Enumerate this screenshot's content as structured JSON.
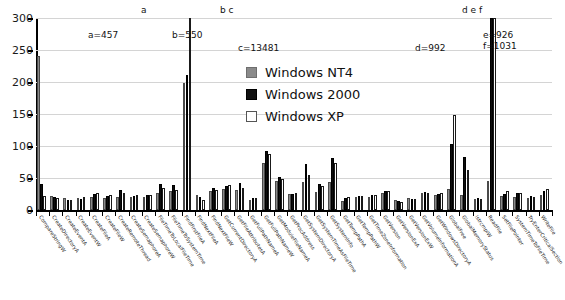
{
  "chart_data": {
    "type": "bar",
    "title": "",
    "xlabel": "",
    "ylabel": "",
    "ylim": [
      0,
      300
    ],
    "ytick_values": [
      0,
      50,
      100,
      150,
      200,
      250,
      300
    ],
    "ytick_labels": [
      "0",
      "50",
      "100",
      "150",
      "200",
      "250",
      "300"
    ],
    "grid": true,
    "legend_position": "upper center",
    "categories": [
      "CompareStringW",
      "CreateDirectoryA",
      "CreateEventA",
      "CreateEventW",
      "CreateFileA",
      "CreateFileW",
      "CreateRemoteThread",
      "CreateSemaphoreA",
      "CreateSemaphoreW",
      "FileTimeToLocalFileTime",
      "FileTimeToSystemTime",
      "FindFirstFileA",
      "FindNextFileA",
      "FindNextFileW",
      "GetCurrentDirectoryA",
      "GetFileAttributesA",
      "GetFullPathNameA",
      "GetFullPathNameW",
      "GetModuleFileNameA",
      "GetProcAddress",
      "GetSystemDirectoryA",
      "GetSystemTimeAsFileTime",
      "GetSystemInfo",
      "GetTempPathA",
      "GetTempPathW",
      "GetTimeZoneInformation",
      "GetVersion",
      "GetVersionExA",
      "GetVersionExW",
      "GetVolumeInformationA",
      "GetWindowsDirectoryA",
      "GlobalFree",
      "GlobalMemoryStatus",
      "lstrcmpiW",
      "ReadFile",
      "SetFilePointer",
      "SystemTimeToFileTime",
      "TryEnterCriticalSection",
      "WriteFile"
    ],
    "series": [
      {
        "name": "Windows NT4",
        "color": "#8a8a8a",
        "values": [
          241,
          22,
          18,
          18,
          20,
          19,
          21,
          20,
          20,
          26,
          30,
          199,
          24,
          29,
          33,
          31,
          16,
          73,
          46,
          25,
          44,
          28,
          44,
          14,
          21,
          20,
          27,
          15,
          18,
          27,
          23,
          33,
          24,
          17,
          45,
          22,
          20,
          18,
          24
        ]
      },
      {
        "name": "Windows 2000",
        "color": "#111111",
        "values": [
          41,
          20,
          16,
          17,
          25,
          22,
          31,
          22,
          24,
          41,
          39,
          211,
          20,
          34,
          37,
          42,
          18,
          92,
          52,
          25,
          72,
          41,
          82,
          18,
          22,
          23,
          29,
          14,
          17,
          28,
          25,
          103,
          83,
          18,
          550,
          25,
          26,
          22,
          29
        ]
      },
      {
        "name": "Windows XP",
        "color": "#ffffff",
        "values": [
          22,
          19,
          16,
          21,
          26,
          23,
          27,
          23,
          23,
          34,
          31,
          457,
          16,
          31,
          39,
          35,
          18,
          88,
          49,
          26,
          55,
          37,
          73,
          21,
          22,
          24,
          30,
          13,
          17,
          27,
          26,
          148,
          63,
          17,
          13481,
          29,
          26,
          20,
          33
        ]
      }
    ],
    "overflow_markers": [
      {
        "letter": "a",
        "x_index": 11,
        "series": "Windows XP",
        "label": "a=457",
        "value": 457
      },
      {
        "letter": "b",
        "x_index": 34,
        "series": "Windows 2000",
        "label": "b=550",
        "value": 550
      },
      {
        "letter": "c",
        "x_index": 34,
        "series": "Windows XP",
        "label": "c=13481",
        "value": 13481
      },
      {
        "letter": "d",
        "x_index": 33,
        "series": "Windows NT4",
        "label": "d=992",
        "value": 992
      },
      {
        "letter": "e",
        "x_index": 33,
        "series": "Windows 2000",
        "label": "e=926",
        "value": 926
      },
      {
        "letter": "f",
        "x_index": 33,
        "series": "Windows XP",
        "label": "f=1031",
        "value": 1031
      }
    ]
  },
  "legend": {
    "items": [
      {
        "label": "Windows NT4",
        "swatch": "nt4"
      },
      {
        "label": "Windows 2000",
        "swatch": "w2k"
      },
      {
        "label": "Windows XP",
        "swatch": "xp"
      }
    ]
  },
  "markers": {
    "a": "a",
    "bc": "b c",
    "def": "d e f"
  },
  "annotations": {
    "a": "a=457",
    "b": "b=550",
    "c": "c=13481",
    "d": "d=992",
    "ef": "e=926\nf=1031"
  }
}
